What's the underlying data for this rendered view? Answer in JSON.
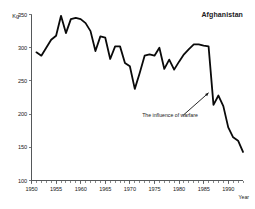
{
  "chart_data": {
    "type": "line",
    "title": "Afghanistan",
    "xlabel": "Year",
    "ylabel": "Kg",
    "xlim": [
      1950,
      1993
    ],
    "ylim": [
      100,
      350
    ],
    "grid": false,
    "legend": "none",
    "y_ticks": [
      100,
      150,
      200,
      250,
      300,
      350
    ],
    "y_tick_labels": [
      "100",
      "150",
      "200",
      "250",
      "300",
      "350"
    ],
    "x_ticks": [
      1950,
      1955,
      1960,
      1965,
      1970,
      1975,
      1980,
      1985,
      1990
    ],
    "x_tick_labels": [
      "1950",
      "1955",
      "1960",
      "1965",
      "1970",
      "1975",
      "1980",
      "1985",
      "1990"
    ],
    "x_minor_tick_step": 1,
    "annotations": [
      {
        "text": "The influence of warfare",
        "x": 1972.5,
        "y": 196,
        "arrow_to_x": 1986.0,
        "arrow_to_y": 232
      }
    ],
    "series": [
      {
        "name": "Afghanistan",
        "color": "#0a0a0a",
        "x": [
          1951,
          1952,
          1953,
          1954,
          1955,
          1956,
          1957,
          1958,
          1959,
          1960,
          1961,
          1962,
          1963,
          1964,
          1965,
          1966,
          1967,
          1968,
          1969,
          1970,
          1971,
          1972,
          1973,
          1974,
          1975,
          1976,
          1977,
          1978,
          1979,
          1980,
          1981,
          1982,
          1983,
          1984,
          1985,
          1986,
          1987,
          1988,
          1989,
          1990,
          1991,
          1992,
          1993
        ],
        "values": [
          293,
          288,
          300,
          312,
          318,
          348,
          322,
          343,
          345,
          343,
          337,
          325,
          295,
          317,
          315,
          283,
          302,
          302,
          277,
          272,
          238,
          262,
          288,
          290,
          288,
          300,
          268,
          282,
          267,
          279,
          290,
          298,
          305,
          305,
          303,
          302,
          214,
          228,
          212,
          180,
          165,
          160,
          143
        ]
      }
    ]
  }
}
